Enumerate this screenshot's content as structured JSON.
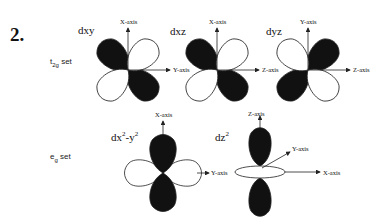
{
  "figure": {
    "number": "2.",
    "sets": {
      "t2g": {
        "label": "t",
        "sub": "2g",
        "suffix": " set"
      },
      "eg": {
        "label": "e",
        "sub": "g",
        "suffix": " set"
      }
    },
    "orbitals": {
      "dxy": {
        "label": "dxy",
        "vertical_axis": "X-axis",
        "horizontal_axis": "Y-axis"
      },
      "dxz": {
        "label": "dxz",
        "vertical_axis": "X-axis",
        "horizontal_axis": "Z-axis"
      },
      "dyz": {
        "label": "dyz",
        "vertical_axis": "Y-axis",
        "horizontal_axis_left": "Z-axis",
        "horizontal_axis_right": "Z-axis"
      },
      "dx2y2": {
        "label_main": "dx",
        "sup1": "2",
        "label_mid": "-y",
        "sup2": "2",
        "vertical_axis": "X-axis",
        "horizontal_axis": "Y-axis"
      },
      "dz2": {
        "label_main": "dz",
        "sup": "2",
        "vertical_axis": "Z-axis",
        "diagonal_axis": "Y-axis",
        "horizontal_axis": "X-axis"
      }
    },
    "colors": {
      "filled_lobe": "#111111",
      "open_lobe": "#ffffff",
      "line": "#222222"
    }
  }
}
